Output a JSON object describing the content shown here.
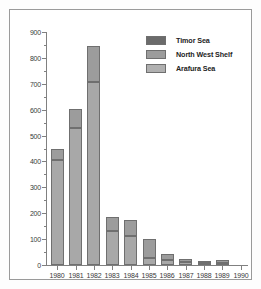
{
  "chart_data": {
    "type": "bar",
    "subtype": "stacked-vertical",
    "title": "",
    "xlabel": "",
    "ylabel": "",
    "ylim": [
      0,
      900
    ],
    "ytick_values": [
      0,
      100,
      200,
      300,
      400,
      500,
      600,
      700,
      800,
      900
    ],
    "ytick_labels": [
      "0",
      "100",
      "200",
      "300",
      "400",
      "500",
      "600",
      "700",
      "800",
      "900"
    ],
    "minor_ticks": true,
    "grid": false,
    "legend_position": "top-right",
    "categories": [
      "1980",
      "1981",
      "1982",
      "1983",
      "1984",
      "1985",
      "1986",
      "1987",
      "1988",
      "1989",
      "1990"
    ],
    "series": [
      {
        "name": "Arafura Sea",
        "color": "#a8a8a8",
        "values": [
          405,
          530,
          708,
          130,
          113,
          28,
          20,
          10,
          6,
          8,
          0
        ]
      },
      {
        "name": "North West Shelf",
        "color": "#9c9c9c",
        "values": [
          45,
          72,
          137,
          55,
          61,
          73,
          21,
          15,
          9,
          11,
          0
        ]
      },
      {
        "name": "Timor Sea",
        "color": "#6b6b6b",
        "values": [
          0,
          0,
          0,
          0,
          0,
          0,
          0,
          0,
          0,
          0,
          0
        ]
      }
    ],
    "totals": [
      450,
      602,
      845,
      185,
      174,
      101,
      41,
      25,
      15,
      19,
      0
    ]
  },
  "legend": {
    "items": [
      {
        "label": "Timor Sea",
        "color": "#6b6b6b"
      },
      {
        "label": "North West Shelf",
        "color": "#9c9c9c"
      },
      {
        "label": "Arafura Sea",
        "color": "#b0b0b0"
      }
    ]
  },
  "colors": {
    "timor_sea": "#6b6b6b",
    "north_west_shelf": "#9c9c9c",
    "arafura_sea": "#b0b0b0",
    "axis": "#808080",
    "border": "#9a9a9a",
    "text": "#3a3a3a",
    "background": "#ffffff"
  }
}
